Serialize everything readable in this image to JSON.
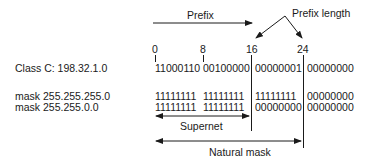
{
  "labels": {
    "prefix": "Prefix",
    "prefix_length": "Prefix length",
    "supernet": "Supernet",
    "natural_mask": "Natural mask"
  },
  "ticks": [
    "0",
    "8",
    "16",
    "24"
  ],
  "rows": [
    {
      "label": "Class C: 198.32.1.0",
      "octets": [
        "11000110",
        "00100000",
        "00000001",
        "00000000"
      ]
    },
    {
      "label": "mask 255.255.255.0",
      "octets": [
        "11111111",
        "11111111",
        "11111111",
        "00000000"
      ]
    },
    {
      "label": "mask 255.255.0.0",
      "octets": [
        "11111111",
        "11111111",
        "00000000",
        "00000000"
      ]
    }
  ],
  "colors": {
    "ink": "#1a1a1a",
    "background": "#ffffff"
  }
}
